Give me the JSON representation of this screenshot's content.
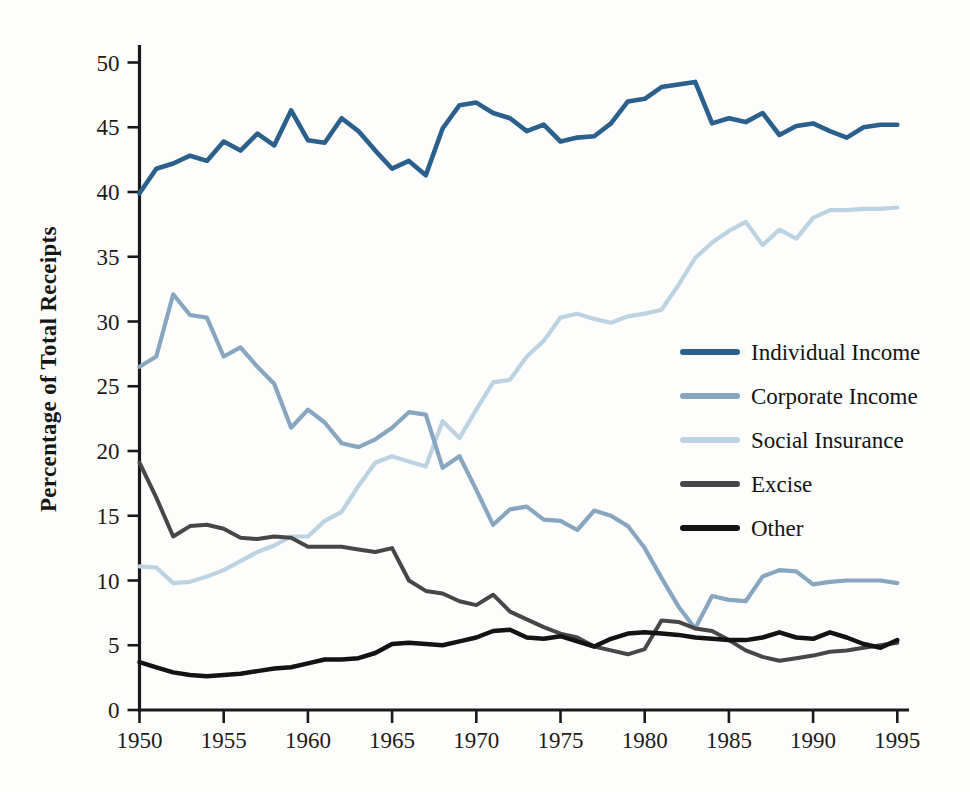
{
  "page": {
    "background_color": "#fdfdfb",
    "axis_color": "#1a1a1a",
    "text_color": "#1b1b1b"
  },
  "chart_data": {
    "type": "line",
    "title": "",
    "xlabel": "",
    "ylabel": "Percentage of Total Receipts",
    "xlim": [
      1950,
      1995
    ],
    "ylim": [
      0,
      50
    ],
    "x_ticks": [
      1950,
      1955,
      1960,
      1965,
      1970,
      1975,
      1980,
      1985,
      1990,
      1995
    ],
    "y_ticks": [
      0,
      5,
      10,
      15,
      20,
      25,
      30,
      35,
      40,
      45,
      50
    ],
    "grid": false,
    "legend_position": "center-right",
    "x": [
      1950,
      1951,
      1952,
      1953,
      1954,
      1955,
      1956,
      1957,
      1958,
      1959,
      1960,
      1961,
      1962,
      1963,
      1964,
      1965,
      1966,
      1967,
      1968,
      1969,
      1970,
      1971,
      1972,
      1973,
      1974,
      1975,
      1976,
      1977,
      1978,
      1979,
      1980,
      1981,
      1982,
      1983,
      1984,
      1985,
      1986,
      1987,
      1988,
      1989,
      1990,
      1991,
      1992,
      1993,
      1994,
      1995
    ],
    "series": [
      {
        "name": "Social Insurance",
        "color": "#bed3e1",
        "line_width": 4.2,
        "values": [
          11.1,
          11.0,
          9.8,
          9.9,
          10.3,
          10.8,
          11.5,
          12.2,
          12.7,
          13.4,
          13.4,
          14.6,
          15.3,
          17.3,
          19.1,
          19.6,
          19.2,
          18.8,
          22.3,
          21.0,
          23.2,
          25.3,
          25.5,
          27.3,
          28.5,
          30.3,
          30.6,
          30.2,
          29.9,
          30.4,
          30.6,
          30.9,
          32.8,
          34.9,
          36.1,
          37.0,
          37.7,
          35.9,
          37.1,
          36.4,
          38.0,
          38.6,
          38.6,
          38.7,
          38.7,
          38.8
        ]
      },
      {
        "name": "Corporate Income",
        "color": "#88a6c0",
        "line_width": 4.2,
        "values": [
          26.5,
          27.3,
          32.1,
          30.5,
          30.3,
          27.3,
          28.0,
          26.5,
          25.2,
          21.8,
          23.2,
          22.2,
          20.6,
          20.3,
          20.9,
          21.8,
          23.0,
          22.8,
          18.7,
          19.6,
          17.0,
          14.3,
          15.5,
          15.7,
          14.7,
          14.6,
          13.9,
          15.4,
          15.0,
          14.2,
          12.5,
          10.2,
          8.0,
          6.3,
          8.8,
          8.5,
          8.4,
          10.3,
          10.8,
          10.7,
          9.7,
          9.9,
          10.0,
          10.0,
          10.0,
          9.8
        ]
      },
      {
        "name": "Excise",
        "color": "#474747",
        "line_width": 4.0,
        "values": [
          19.1,
          16.4,
          13.4,
          14.2,
          14.3,
          14.0,
          13.3,
          13.2,
          13.4,
          13.3,
          12.6,
          12.6,
          12.6,
          12.4,
          12.2,
          12.5,
          10.0,
          9.2,
          9.0,
          8.4,
          8.1,
          8.9,
          7.6,
          7.0,
          6.4,
          5.9,
          5.6,
          4.9,
          4.6,
          4.3,
          4.7,
          6.9,
          6.8,
          6.3,
          6.1,
          5.4,
          4.6,
          4.1,
          3.8,
          4.0,
          4.2,
          4.5,
          4.6,
          4.8,
          5.0,
          5.2
        ]
      },
      {
        "name": "Other",
        "color": "#131313",
        "line_width": 4.5,
        "values": [
          3.7,
          3.3,
          2.9,
          2.7,
          2.6,
          2.7,
          2.8,
          3.0,
          3.2,
          3.3,
          3.6,
          3.9,
          3.9,
          4.0,
          4.4,
          5.1,
          5.2,
          5.1,
          5.0,
          5.3,
          5.6,
          6.1,
          6.2,
          5.6,
          5.5,
          5.7,
          5.3,
          4.9,
          5.5,
          5.9,
          6.0,
          5.9,
          5.8,
          5.6,
          5.5,
          5.4,
          5.4,
          5.6,
          6.0,
          5.6,
          5.5,
          6.0,
          5.6,
          5.1,
          4.8,
          5.4
        ]
      },
      {
        "name": "Individual Income",
        "color": "#2b5f8c",
        "line_width": 4.6,
        "values": [
          39.9,
          41.8,
          42.2,
          42.8,
          42.4,
          43.9,
          43.2,
          44.5,
          43.6,
          46.3,
          44.0,
          43.8,
          45.7,
          44.7,
          43.2,
          41.8,
          42.4,
          41.3,
          44.9,
          46.7,
          46.9,
          46.1,
          45.7,
          44.7,
          45.2,
          43.9,
          44.2,
          44.3,
          45.3,
          47.0,
          47.2,
          48.1,
          48.3,
          48.5,
          45.3,
          45.7,
          45.4,
          46.1,
          44.4,
          45.1,
          45.3,
          44.7,
          44.2,
          45.0,
          45.2,
          45.2
        ]
      }
    ],
    "legend_order": [
      "Individual Income",
      "Corporate Income",
      "Social Insurance",
      "Excise",
      "Other"
    ]
  }
}
